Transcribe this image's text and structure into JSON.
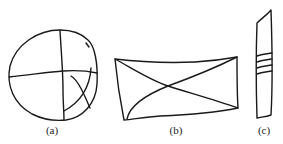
{
  "figure": {
    "panels": [
      {
        "id": "a",
        "label": "(a)",
        "shape": "circle-with-cross-and-curves",
        "label_x": 52
      },
      {
        "id": "b",
        "label": "(b)",
        "shape": "rectangle-with-diagonals",
        "label_x": 176
      },
      {
        "id": "c",
        "label": "(c)",
        "shape": "vertical-strip-with-three-bands",
        "label_x": 264
      }
    ],
    "stroke_color": "#1a1a1a",
    "background": "#ffffff"
  }
}
